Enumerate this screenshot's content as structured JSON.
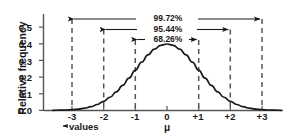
{
  "chart_data": {
    "type": "line",
    "title": "",
    "subtitle": "",
    "xlabel": "values",
    "ylabel": "Relative frequency",
    "x_tick_labels": [
      "-3",
      "-2",
      "-1",
      "0",
      "+1",
      "+2",
      "+3"
    ],
    "x_tick_values": [
      -3,
      -2,
      -1,
      0,
      1,
      2,
      3
    ],
    "y_tick_labels": [
      "0.0",
      "0.1",
      "0.2",
      "0.3",
      "0.4",
      "0.5"
    ],
    "y_tick_values": [
      0.0,
      0.1,
      0.2,
      0.3,
      0.4,
      0.5
    ],
    "xlim": [
      -3.6,
      3.6
    ],
    "ylim": [
      0.0,
      0.56
    ],
    "grid": false,
    "legend": false,
    "series": [
      {
        "name": "standard normal density",
        "x": [
          -3.6,
          -3.4,
          -3.2,
          -3.0,
          -2.8,
          -2.6,
          -2.4,
          -2.2,
          -2.0,
          -1.8,
          -1.6,
          -1.4,
          -1.2,
          -1.0,
          -0.8,
          -0.6,
          -0.4,
          -0.2,
          0.0,
          0.2,
          0.4,
          0.6,
          0.8,
          1.0,
          1.2,
          1.4,
          1.6,
          1.8,
          2.0,
          2.2,
          2.4,
          2.6,
          2.8,
          3.0,
          3.2,
          3.4,
          3.6
        ],
        "values": [
          0.0006,
          0.0012,
          0.0024,
          0.0044,
          0.0079,
          0.0136,
          0.0224,
          0.0355,
          0.054,
          0.079,
          0.1109,
          0.1497,
          0.1942,
          0.242,
          0.2897,
          0.3332,
          0.3683,
          0.391,
          0.3989,
          0.391,
          0.3683,
          0.3332,
          0.2897,
          0.242,
          0.1942,
          0.1497,
          0.1109,
          0.079,
          0.054,
          0.0355,
          0.0224,
          0.0136,
          0.0079,
          0.0044,
          0.0024,
          0.0012,
          0.0006
        ]
      }
    ],
    "reference_lines": {
      "style": "dashed",
      "at_x": [
        -3,
        -2,
        -1,
        1,
        2,
        3
      ]
    },
    "annotations": [
      {
        "label": "99.72%",
        "from_x": -3,
        "to_x": 3,
        "span_sigma": 6
      },
      {
        "label": "95.44%",
        "from_x": -2,
        "to_x": 2,
        "span_sigma": 4
      },
      {
        "label": "68.26%",
        "from_x": -1,
        "to_x": 1,
        "span_sigma": 2
      }
    ],
    "mean_symbol": "μ",
    "mean_x": 0,
    "values_note": "values",
    "colors": {
      "curve": "#1a1a1a",
      "axis": "#555555",
      "dashed": "#555555",
      "arrow": "#1a1a1a",
      "text": "#1a1a1a",
      "background": "#ffffff"
    }
  }
}
